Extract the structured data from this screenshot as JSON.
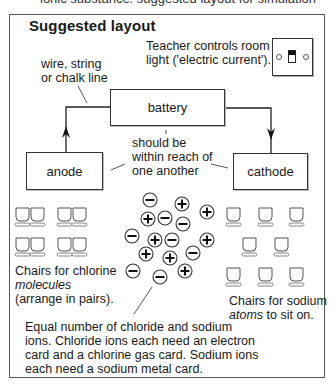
{
  "header_cut_text": "ionic substance: suggested layout for simulation",
  "title": "Suggested layout",
  "switch_caption": [
    "Teacher controls room",
    "light ('electric current')."
  ],
  "wire_label": [
    "wire, string",
    "or chalk line"
  ],
  "boxes": {
    "battery": "battery",
    "anode": "anode",
    "cathode": "cathode"
  },
  "reach_note": [
    "should be",
    "within reach of",
    "one another"
  ],
  "chlorine_chairs_label": {
    "line1": "Chairs for chlorine",
    "line2_italic": "molecules",
    "line3": "(arrange in pairs)."
  },
  "sodium_chairs_label": {
    "line1": "Chairs for sodium",
    "line2_italic": "atoms",
    "line2_rest": " to sit on."
  },
  "ions_note": [
    "Equal number of chloride and sodium",
    "ions. Chloride ions each need an electron",
    "card and a chlorine gas card. Sodium ions",
    "each need a sodium metal card."
  ],
  "ions": [
    {
      "sign": "−",
      "x": 150,
      "y": 200
    },
    {
      "sign": "+",
      "x": 182,
      "y": 204
    },
    {
      "sign": "+",
      "x": 207,
      "y": 212
    },
    {
      "sign": "+",
      "x": 148,
      "y": 219
    },
    {
      "sign": "−",
      "x": 165,
      "y": 218
    },
    {
      "sign": "−",
      "x": 183,
      "y": 224
    },
    {
      "sign": "−",
      "x": 132,
      "y": 236
    },
    {
      "sign": "+",
      "x": 155,
      "y": 240
    },
    {
      "sign": "−",
      "x": 172,
      "y": 240
    },
    {
      "sign": "+",
      "x": 207,
      "y": 240
    },
    {
      "sign": "+",
      "x": 146,
      "y": 254
    },
    {
      "sign": "+",
      "x": 170,
      "y": 258
    },
    {
      "sign": "−",
      "x": 193,
      "y": 253
    },
    {
      "sign": "−",
      "x": 133,
      "y": 271
    },
    {
      "sign": "−",
      "x": 160,
      "y": 277
    },
    {
      "sign": "+",
      "x": 185,
      "y": 271
    }
  ],
  "chlorine_chairs": [
    {
      "x": 16,
      "y": 208
    },
    {
      "x": 31,
      "y": 208
    },
    {
      "x": 58,
      "y": 208
    },
    {
      "x": 73,
      "y": 208
    },
    {
      "x": 16,
      "y": 238
    },
    {
      "x": 31,
      "y": 238
    },
    {
      "x": 58,
      "y": 238
    },
    {
      "x": 73,
      "y": 238
    }
  ],
  "sodium_chairs": [
    {
      "x": 227,
      "y": 208
    },
    {
      "x": 259,
      "y": 208
    },
    {
      "x": 290,
      "y": 208
    },
    {
      "x": 243,
      "y": 238
    },
    {
      "x": 275,
      "y": 238
    },
    {
      "x": 227,
      "y": 268
    },
    {
      "x": 259,
      "y": 268
    },
    {
      "x": 290,
      "y": 268
    }
  ]
}
